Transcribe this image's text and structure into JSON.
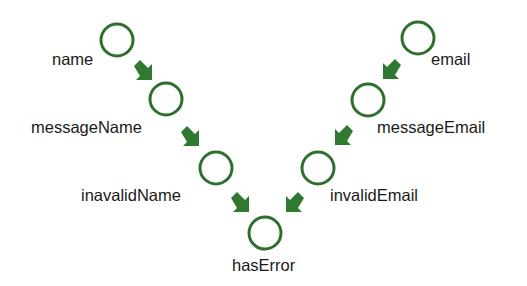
{
  "diagram": {
    "colors": {
      "node_stroke": "#2e6f2e",
      "arrow_fill": "#2f7a30",
      "label": "#1a1a1a",
      "background": "#ffffff"
    },
    "nodes": [
      {
        "id": "name",
        "label": "name",
        "cx": 117,
        "cy": 40
      },
      {
        "id": "messageName",
        "label": "messageName",
        "cx": 166,
        "cy": 99
      },
      {
        "id": "inavalidName",
        "label": "inavalidName",
        "cx": 216,
        "cy": 168
      },
      {
        "id": "email",
        "label": "email",
        "cx": 418,
        "cy": 38
      },
      {
        "id": "messageEmail",
        "label": "messageEmail",
        "cx": 368,
        "cy": 100
      },
      {
        "id": "invalidEmail",
        "label": "invalidEmail",
        "cx": 318,
        "cy": 168
      },
      {
        "id": "hasError",
        "label": "hasError",
        "cx": 265,
        "cy": 233
      }
    ],
    "edges": [
      {
        "from": "name",
        "to": "messageName"
      },
      {
        "from": "messageName",
        "to": "inavalidName"
      },
      {
        "from": "inavalidName",
        "to": "hasError"
      },
      {
        "from": "email",
        "to": "messageEmail"
      },
      {
        "from": "messageEmail",
        "to": "invalidEmail"
      },
      {
        "from": "invalidEmail",
        "to": "hasError"
      }
    ]
  }
}
